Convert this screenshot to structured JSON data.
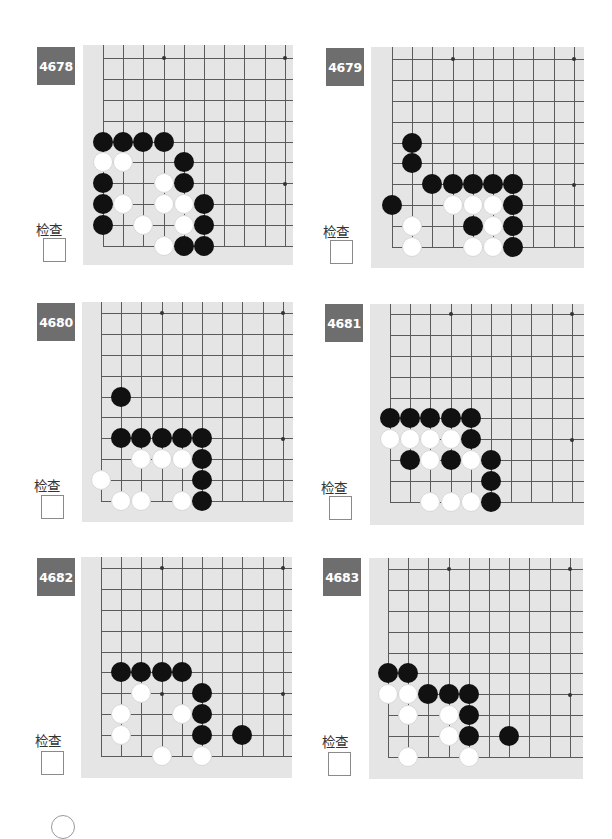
{
  "check_label": "检查",
  "grid": {
    "dx": 20.2,
    "dy": 20.9,
    "cols": 10,
    "rows": 10,
    "stars": [
      [
        3,
        3
      ],
      [
        3,
        9
      ],
      [
        9,
        3
      ],
      [
        9,
        9
      ]
    ]
  },
  "colors": {
    "label_bg": "#6e6e6e",
    "board_bg": "#e5e5e5",
    "line": "#5a5a5a",
    "black": "#111111",
    "white": "#ffffff"
  },
  "problems": [
    {
      "number": "4678",
      "label_pos": [
        37,
        47
      ],
      "check_pos": [
        29,
        219
      ],
      "checkbox_pos": [
        43,
        238
      ],
      "board": {
        "x": 83,
        "y": 45,
        "w": 210,
        "h": 220,
        "origin_x": 20,
        "origin_y": 201
      },
      "black": [
        [
          0,
          5
        ],
        [
          1,
          5
        ],
        [
          2,
          5
        ],
        [
          3,
          5
        ],
        [
          4,
          4
        ],
        [
          0,
          3
        ],
        [
          4,
          3
        ],
        [
          0,
          2
        ],
        [
          5,
          2
        ],
        [
          0,
          1
        ],
        [
          5,
          1
        ],
        [
          4,
          0
        ],
        [
          5,
          0
        ]
      ],
      "white": [
        [
          0,
          4
        ],
        [
          1,
          4
        ],
        [
          3,
          3
        ],
        [
          1,
          2
        ],
        [
          3,
          2
        ],
        [
          4,
          2
        ],
        [
          2,
          1
        ],
        [
          4,
          1
        ],
        [
          3,
          0
        ]
      ]
    },
    {
      "number": "4679",
      "label_pos": [
        326,
        48
      ],
      "check_pos": [
        316,
        221
      ],
      "checkbox_pos": [
        330,
        240
      ],
      "board": {
        "x": 371,
        "y": 47,
        "w": 213,
        "h": 221,
        "origin_x": 21,
        "origin_y": 200
      },
      "black": [
        [
          1,
          5
        ],
        [
          1,
          4
        ],
        [
          2,
          3
        ],
        [
          3,
          3
        ],
        [
          4,
          3
        ],
        [
          5,
          3
        ],
        [
          6,
          3
        ],
        [
          0,
          2
        ],
        [
          6,
          2
        ],
        [
          4,
          1
        ],
        [
          6,
          1
        ],
        [
          6,
          0
        ]
      ],
      "white": [
        [
          3,
          2
        ],
        [
          4,
          2
        ],
        [
          5,
          2
        ],
        [
          1,
          1
        ],
        [
          5,
          1
        ],
        [
          1,
          0
        ],
        [
          4,
          0
        ],
        [
          5,
          0
        ]
      ]
    },
    {
      "number": "4680",
      "label_pos": [
        37,
        303
      ],
      "check_pos": [
        27,
        475
      ],
      "checkbox_pos": [
        41,
        495
      ],
      "board": {
        "x": 82,
        "y": 302,
        "w": 211,
        "h": 220,
        "origin_x": 19,
        "origin_y": 199
      },
      "black": [
        [
          1,
          5
        ],
        [
          1,
          3
        ],
        [
          2,
          3
        ],
        [
          3,
          3
        ],
        [
          4,
          3
        ],
        [
          5,
          3
        ],
        [
          5,
          2
        ],
        [
          5,
          1
        ],
        [
          5,
          0
        ]
      ],
      "white": [
        [
          2,
          2
        ],
        [
          3,
          2
        ],
        [
          4,
          2
        ],
        [
          0,
          1
        ],
        [
          1,
          0
        ],
        [
          2,
          0
        ],
        [
          4,
          0
        ]
      ]
    },
    {
      "number": "4681",
      "label_pos": [
        325,
        304
      ],
      "check_pos": [
        314,
        477
      ],
      "checkbox_pos": [
        329,
        496
      ],
      "board": {
        "x": 370,
        "y": 304,
        "w": 214,
        "h": 221,
        "origin_x": 20,
        "origin_y": 198
      },
      "black": [
        [
          0,
          4
        ],
        [
          1,
          4
        ],
        [
          2,
          4
        ],
        [
          3,
          4
        ],
        [
          4,
          4
        ],
        [
          4,
          3
        ],
        [
          1,
          2
        ],
        [
          3,
          2
        ],
        [
          5,
          2
        ],
        [
          5,
          1
        ],
        [
          5,
          0
        ]
      ],
      "white": [
        [
          0,
          3
        ],
        [
          1,
          3
        ],
        [
          2,
          3
        ],
        [
          3,
          3
        ],
        [
          2,
          2
        ],
        [
          4,
          2
        ],
        [
          2,
          0
        ],
        [
          3,
          0
        ],
        [
          4,
          0
        ]
      ]
    },
    {
      "number": "4682",
      "label_pos": [
        37,
        558
      ],
      "check_pos": [
        28,
        730
      ],
      "checkbox_pos": [
        41,
        751
      ],
      "board": {
        "x": 81,
        "y": 557,
        "w": 211,
        "h": 221,
        "origin_x": 20,
        "origin_y": 199
      },
      "black": [
        [
          1,
          4
        ],
        [
          2,
          4
        ],
        [
          3,
          4
        ],
        [
          4,
          4
        ],
        [
          5,
          3
        ],
        [
          5,
          2
        ],
        [
          5,
          1
        ],
        [
          7,
          1
        ]
      ],
      "white": [
        [
          2,
          3
        ],
        [
          1,
          2
        ],
        [
          4,
          2
        ],
        [
          1,
          1
        ],
        [
          3,
          0
        ],
        [
          5,
          0
        ]
      ]
    },
    {
      "number": "4683",
      "label_pos": [
        323,
        558
      ],
      "check_pos": [
        315,
        731
      ],
      "checkbox_pos": [
        328,
        752
      ],
      "board": {
        "x": 369,
        "y": 558,
        "w": 214,
        "h": 221,
        "origin_x": 19,
        "origin_y": 199
      },
      "black": [
        [
          0,
          4
        ],
        [
          1,
          4
        ],
        [
          2,
          3
        ],
        [
          3,
          3
        ],
        [
          4,
          3
        ],
        [
          4,
          2
        ],
        [
          4,
          1
        ],
        [
          6,
          1
        ]
      ],
      "white": [
        [
          0,
          3
        ],
        [
          1,
          3
        ],
        [
          1,
          2
        ],
        [
          3,
          2
        ],
        [
          3,
          1
        ],
        [
          1,
          0
        ],
        [
          4,
          0
        ]
      ]
    }
  ]
}
